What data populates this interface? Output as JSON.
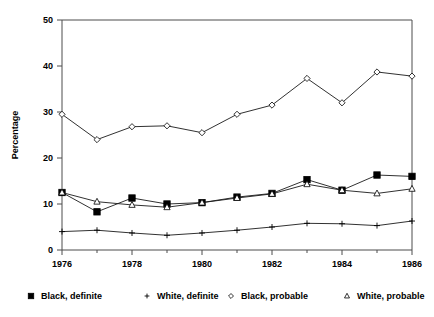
{
  "chart_data": {
    "type": "line",
    "title": "",
    "xlabel": "",
    "ylabel": "Percentage",
    "xlim": [
      1976,
      1986
    ],
    "ylim": [
      0,
      50
    ],
    "grid": false,
    "legend_position": "bottom",
    "x": [
      1976,
      1977,
      1978,
      1979,
      1980,
      1981,
      1982,
      1983,
      1984,
      1985,
      1986
    ],
    "xtick_labels": [
      "1976",
      "1978",
      "1980",
      "1982",
      "1984",
      "1986"
    ],
    "xtick_values": [
      1976,
      1978,
      1980,
      1982,
      1984,
      1986
    ],
    "xminor_tick_values": [
      1977,
      1979,
      1981,
      1983,
      1985
    ],
    "ytick_labels": [
      "0",
      "10",
      "20",
      "30",
      "40",
      "50"
    ],
    "ytick_values": [
      0,
      10,
      20,
      30,
      40,
      50
    ],
    "series": [
      {
        "name": "Black, definite",
        "marker": "filled-square",
        "values": [
          12.5,
          8.3,
          11.3,
          10.0,
          10.3,
          11.5,
          12.3,
          15.3,
          13.0,
          16.3,
          16.0
        ]
      },
      {
        "name": "White, definite",
        "marker": "plus",
        "values": [
          4.0,
          4.3,
          3.7,
          3.2,
          3.7,
          4.3,
          5.0,
          5.8,
          5.7,
          5.3,
          6.3
        ]
      },
      {
        "name": "Black, probable",
        "marker": "open-diamond",
        "values": [
          29.5,
          24.0,
          26.8,
          27.0,
          25.5,
          29.5,
          31.5,
          37.3,
          32.0,
          38.7,
          37.8
        ]
      },
      {
        "name": "White, probable",
        "marker": "open-triangle",
        "values": [
          12.5,
          10.5,
          9.8,
          9.3,
          10.3,
          11.3,
          12.2,
          14.3,
          13.0,
          12.3,
          13.3
        ]
      }
    ]
  },
  "legend": {
    "items": [
      {
        "label": "Black, definite",
        "marker": "filled-square"
      },
      {
        "label": "White, definite",
        "marker": "plus"
      },
      {
        "label": "Black, probable",
        "marker": "open-diamond"
      },
      {
        "label": "White, probable",
        "marker": "open-triangle"
      }
    ]
  },
  "colors": {
    "line": "#1a1a1a",
    "axis": "#4d4d4d",
    "text": "#000000",
    "background": "#ffffff"
  }
}
